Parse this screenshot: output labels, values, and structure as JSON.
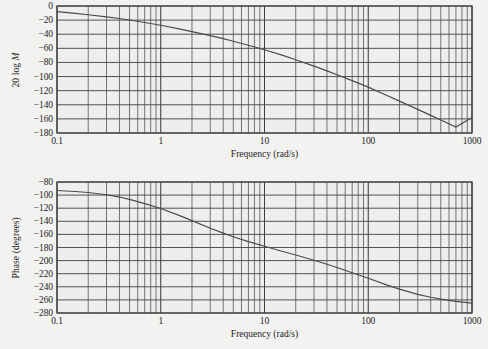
{
  "figure": {
    "title": "",
    "background_color": "#f2f2f0",
    "ink_color": "#4a4a4a"
  },
  "chart_data": [
    {
      "type": "line",
      "name": "magnitude-bode-plot",
      "title": "",
      "xlabel": "Frequency (rad/s)",
      "ylabel": "20 log M",
      "xscale": "log",
      "xlim": [
        0.1,
        1000
      ],
      "ylim": [
        -180,
        0
      ],
      "grid": true,
      "legend": "none",
      "xticks": [
        "0.1",
        "1",
        "10",
        "100",
        "1000"
      ],
      "xtick_values": [
        0.1,
        1,
        10,
        100,
        1000
      ],
      "yticks": [
        "0",
        "−20",
        "−40",
        "−60",
        "−80",
        "−100",
        "−120",
        "−140",
        "−160",
        "−180"
      ],
      "ytick_values": [
        0,
        -20,
        -40,
        -60,
        -80,
        -100,
        -120,
        -140,
        -160,
        -180
      ],
      "series": [
        {
          "name": "20 log M",
          "x": [
            0.1,
            0.15,
            0.2,
            0.3,
            0.4,
            0.5,
            0.7,
            1.0,
            1.5,
            2.0,
            3.0,
            4.0,
            5.0,
            7.0,
            10.0,
            15.0,
            20.0,
            30.0,
            40.0,
            50.0,
            70.0,
            100.0,
            150.0,
            200.0,
            300.0,
            400.0,
            500.0,
            700.0,
            1000.0
          ],
          "y": [
            -8.0,
            -10.5,
            -12.4,
            -15.4,
            -17.7,
            -19.8,
            -23.4,
            -27.3,
            -32.5,
            -36.3,
            -42.0,
            -46.3,
            -49.9,
            -55.7,
            -62.0,
            -70.0,
            -76.1,
            -85.2,
            -92.0,
            -97.4,
            -105.8,
            -115.0,
            -126.5,
            -134.8,
            -146.5,
            -155.0,
            -161.6,
            -171.6,
            -158.0
          ]
        }
      ]
    },
    {
      "type": "line",
      "name": "phase-bode-plot",
      "title": "",
      "xlabel": "Frequency (rad/s)",
      "ylabel": "Phase (degrees)",
      "xscale": "log",
      "xlim": [
        0.1,
        1000
      ],
      "ylim": [
        -280,
        -80
      ],
      "grid": true,
      "legend": "none",
      "xticks": [
        "0.1",
        "1",
        "10",
        "100",
        "1000"
      ],
      "xtick_values": [
        0.1,
        1,
        10,
        100,
        1000
      ],
      "yticks": [
        "−80",
        "−100",
        "−120",
        "−140",
        "−160",
        "−180",
        "−200",
        "−220",
        "−240",
        "−260",
        "−280"
      ],
      "ytick_values": [
        -80,
        -100,
        -120,
        -140,
        -160,
        -180,
        -200,
        -220,
        -240,
        -260,
        -280
      ],
      "series": [
        {
          "name": "Phase",
          "x": [
            0.1,
            0.15,
            0.2,
            0.3,
            0.4,
            0.5,
            0.7,
            1.0,
            1.5,
            2.0,
            3.0,
            4.0,
            5.0,
            7.0,
            10.0,
            15.0,
            20.0,
            30.0,
            40.0,
            50.0,
            70.0,
            100.0,
            150.0,
            200.0,
            300.0,
            400.0,
            500.0,
            700.0,
            1000.0
          ],
          "y": [
            -93.0,
            -94.5,
            -96.0,
            -99.5,
            -103.0,
            -106.5,
            -113.0,
            -120.5,
            -131.0,
            -139.0,
            -150.5,
            -158.0,
            -163.5,
            -171.0,
            -178.0,
            -186.0,
            -191.5,
            -199.5,
            -205.5,
            -210.5,
            -218.5,
            -227.0,
            -237.0,
            -243.5,
            -251.5,
            -256.0,
            -258.8,
            -262.2,
            -265.0
          ]
        }
      ]
    }
  ],
  "axes": {
    "magnitude": {
      "ylabel_prefix": "20 log ",
      "ylabel_italic": "M",
      "xlabel": "Frequency (rad/s)"
    },
    "phase": {
      "ylabel": "Phase (degrees)",
      "xlabel": "Frequency (rad/s)"
    }
  }
}
